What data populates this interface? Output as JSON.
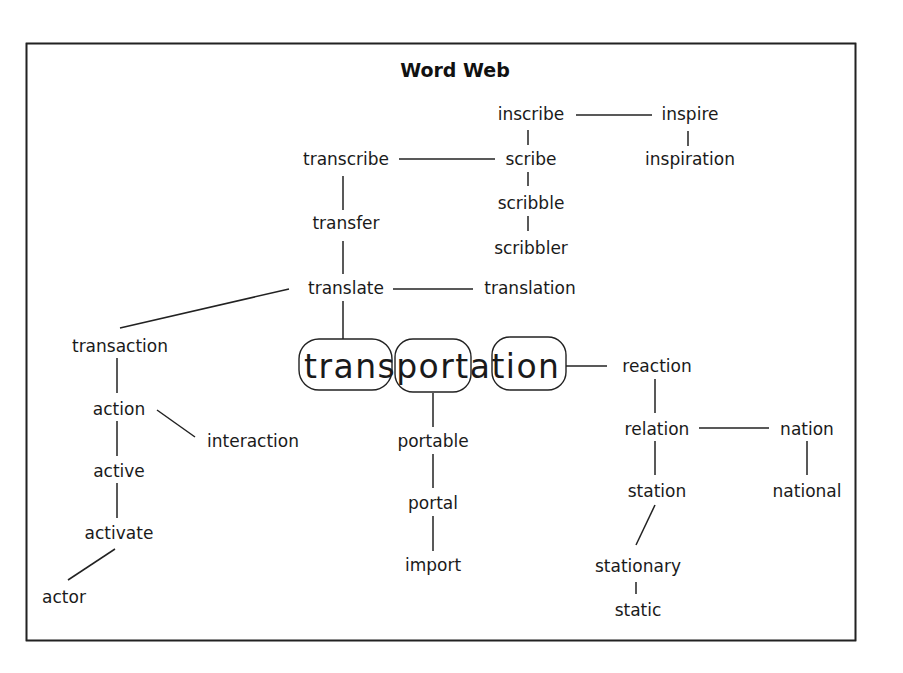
{
  "title": "Word Web",
  "center": {
    "word": "transportation",
    "parts": [
      "trans",
      "port",
      "a",
      "tion"
    ],
    "highlighted_parts": [
      "trans",
      "port",
      "tion"
    ]
  },
  "words": {
    "inscribe": "inscribe",
    "inspire": "inspire",
    "inspiration": "inspiration",
    "transcribe": "transcribe",
    "scribe": "scribe",
    "scribble": "scribble",
    "scribbler": "scribbler",
    "transfer": "transfer",
    "translate": "translate",
    "translation": "translation",
    "transaction": "transaction",
    "action": "action",
    "interaction": "interaction",
    "active": "active",
    "activate": "activate",
    "actor": "actor",
    "portable": "portable",
    "portal": "portal",
    "import": "import",
    "reaction": "reaction",
    "relation": "relation",
    "nation": "nation",
    "station": "station",
    "national": "national",
    "stationary": "stationary",
    "static": "static"
  },
  "links": [
    [
      "inscribe",
      "inspire"
    ],
    [
      "inscribe",
      "scribe"
    ],
    [
      "inspire",
      "inspiration"
    ],
    [
      "transcribe",
      "scribe"
    ],
    [
      "scribe",
      "scribble"
    ],
    [
      "scribble",
      "scribbler"
    ],
    [
      "transcribe",
      "transfer"
    ],
    [
      "transfer",
      "translate"
    ],
    [
      "translate",
      "translation"
    ],
    [
      "translate",
      "transaction"
    ],
    [
      "translate",
      "trans"
    ],
    [
      "transaction",
      "action"
    ],
    [
      "action",
      "interaction"
    ],
    [
      "action",
      "active"
    ],
    [
      "active",
      "activate"
    ],
    [
      "activate",
      "actor"
    ],
    [
      "port",
      "portable"
    ],
    [
      "portable",
      "portal"
    ],
    [
      "portal",
      "import"
    ],
    [
      "tion",
      "reaction"
    ],
    [
      "reaction",
      "relation"
    ],
    [
      "relation",
      "nation"
    ],
    [
      "relation",
      "station"
    ],
    [
      "nation",
      "national"
    ],
    [
      "station",
      "stationary"
    ],
    [
      "stationary",
      "static"
    ]
  ]
}
